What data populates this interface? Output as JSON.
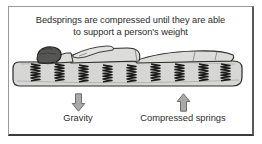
{
  "figure": {
    "caption": {
      "line1": "Bedsprings are compressed until they are able",
      "line2": "to support a person's weight",
      "full_text": "Bedsprings are compressed until they are able to support a person's weight"
    },
    "illustration": {
      "name": "person-lying-on-mattress-with-compressed-springs",
      "parts": [
        "mattress",
        "person-head",
        "person-body",
        "person-arm",
        "person-legs",
        "compressed-springs"
      ],
      "spring_count": 9,
      "colors": {
        "mattress_fill": "#d6d6d4",
        "mattress_shadow": "#b9b9b6",
        "body_fill": "#dcdcda",
        "head_fill": "#555553",
        "outline": "#2b2b2b",
        "spring": "#1f1f1f"
      }
    },
    "legend": [
      {
        "key": "gravity",
        "label": "Gravity",
        "arrow_direction": "down",
        "arrow_icon": "arrow-down-icon",
        "arrow_fill": "#a9a9a7",
        "arrow_stroke": "#6f6f6d"
      },
      {
        "key": "compressed_springs",
        "label": "Compressed springs",
        "arrow_direction": "up",
        "arrow_icon": "arrow-up-icon",
        "arrow_fill": "#a9a9a7",
        "arrow_stroke": "#6f6f6d"
      }
    ],
    "border_colors": {
      "top_left": "#9b9b9b",
      "right": "#5a5a5a",
      "bottom": "#3c3c3c"
    },
    "background": "#ffffff"
  }
}
